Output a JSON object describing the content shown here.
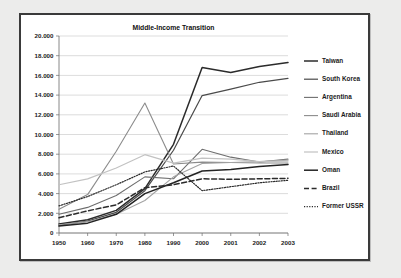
{
  "chart_data": {
    "type": "line",
    "title": "Middle-Income Transition",
    "xlabel": "",
    "ylabel": "",
    "x": [
      1950,
      1960,
      1970,
      1980,
      1990,
      2000,
      2001,
      2002,
      2003
    ],
    "xtick_labels": [
      "1950",
      "1960",
      "1970",
      "1980",
      "1990",
      "2000",
      "2001",
      "2002",
      "2003"
    ],
    "ytick_labels": [
      "0",
      "2.000",
      "4.000",
      "6.000",
      "8.000",
      "10.000",
      "12.000",
      "14.000",
      "16.000",
      "18.000",
      "20.000"
    ],
    "ytick_values": [
      0,
      2000,
      4000,
      6000,
      8000,
      10000,
      12000,
      14000,
      16000,
      18000,
      20000
    ],
    "ylim": [
      0,
      20000
    ],
    "grid": true,
    "legend_position": "right",
    "series": [
      {
        "name": "Taiwan",
        "color": "#2b2b2b",
        "width": 1.5,
        "dash": "none",
        "values": [
          920,
          1350,
          2300,
          4500,
          9000,
          16800,
          16300,
          16900,
          17300
        ]
      },
      {
        "name": "South Korea",
        "color": "#4a4a4a",
        "width": 1.2,
        "dash": "none",
        "values": [
          800,
          1200,
          2100,
          4300,
          8400,
          13950,
          14600,
          15300,
          15700
        ]
      },
      {
        "name": "Argentina",
        "color": "#6e6e6e",
        "width": 1.1,
        "dash": "none",
        "values": [
          1900,
          2600,
          3800,
          5700,
          5500,
          8500,
          7700,
          7200,
          7500
        ]
      },
      {
        "name": "Saudi Arabia",
        "color": "#8c8c8c",
        "width": 1.1,
        "dash": "none",
        "values": [
          2400,
          3900,
          8300,
          13200,
          7000,
          7200,
          7150,
          7100,
          7100
        ]
      },
      {
        "name": "Thailand",
        "color": "#a3a3a3",
        "width": 1.1,
        "dash": "none",
        "values": [
          830,
          1150,
          1900,
          3300,
          5700,
          7050,
          7150,
          7250,
          7400
        ]
      },
      {
        "name": "Mexico",
        "color": "#c2c2c2",
        "width": 1.2,
        "dash": "none",
        "values": [
          4900,
          5500,
          6600,
          7950,
          7100,
          7600,
          7500,
          7250,
          7300
        ]
      },
      {
        "name": "Oman",
        "color": "#232323",
        "width": 1.5,
        "dash": "none",
        "values": [
          700,
          1000,
          1900,
          4000,
          5100,
          6300,
          6450,
          6750,
          6950
        ]
      },
      {
        "name": "Brazil",
        "color": "#2b2b2b",
        "width": 1.5,
        "dash": "5,2.6",
        "values": [
          1550,
          2250,
          2850,
          4600,
          4900,
          5500,
          5450,
          5500,
          5550
        ]
      },
      {
        "name": "Former USSR",
        "color": "#2b2b2b",
        "width": 1.2,
        "dash": "1.2,1.4",
        "values": [
          2750,
          3700,
          4900,
          6200,
          6800,
          4300,
          4700,
          5100,
          5350
        ]
      }
    ]
  },
  "legend": {
    "items": [
      {
        "label": "Taiwan"
      },
      {
        "label": "South Korea"
      },
      {
        "label": "Argentina"
      },
      {
        "label": "Saudi Arabia"
      },
      {
        "label": "Thailand"
      },
      {
        "label": "Mexico"
      },
      {
        "label": "Oman"
      },
      {
        "label": "Brazil"
      },
      {
        "label": "Former USSR"
      }
    ]
  }
}
